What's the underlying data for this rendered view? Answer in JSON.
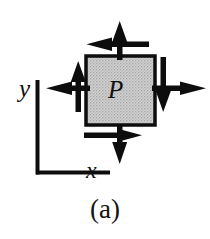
{
  "figure": {
    "caption": "(a)",
    "element_label": "P",
    "axes": {
      "y_label": "y",
      "x_label": "x"
    },
    "colors": {
      "stroke": "#0d0d0d",
      "element_fill": "#c9c9c9",
      "background": "#ffffff"
    },
    "element": {
      "shape": "square",
      "x": 86,
      "y": 56,
      "width": 69,
      "height": 69,
      "fill_pattern": "gray-stipple"
    },
    "arrows": [
      {
        "name": "top-normal-arrow",
        "direction": "up",
        "face": "top",
        "kind": "normal-tension",
        "x1": 120,
        "y1": 56,
        "x2": 120,
        "y2": 22
      },
      {
        "name": "top-shear-arrow",
        "direction": "left",
        "face": "top",
        "kind": "shear",
        "x1": 148,
        "y1": 44,
        "x2": 87,
        "y2": 44
      },
      {
        "name": "right-normal-arrow",
        "direction": "right",
        "face": "right",
        "kind": "normal-tension",
        "x1": 155,
        "y1": 88,
        "x2": 206,
        "y2": 88
      },
      {
        "name": "right-shear-arrow",
        "direction": "down",
        "face": "right",
        "kind": "shear",
        "x1": 163,
        "y1": 57,
        "x2": 163,
        "y2": 112
      },
      {
        "name": "bottom-normal-arrow",
        "direction": "down",
        "face": "bottom",
        "kind": "normal-tension",
        "x1": 120,
        "y1": 125,
        "x2": 120,
        "y2": 164
      },
      {
        "name": "bottom-shear-arrow",
        "direction": "right",
        "face": "bottom",
        "kind": "shear",
        "x1": 84,
        "y1": 135,
        "x2": 142,
        "y2": 135
      },
      {
        "name": "left-normal-arrow",
        "direction": "left",
        "face": "left",
        "kind": "normal-tension",
        "x1": 86,
        "y1": 88,
        "x2": 46,
        "y2": 88
      },
      {
        "name": "left-shear-arrow",
        "direction": "up",
        "face": "left",
        "kind": "shear",
        "x1": 78,
        "y1": 112,
        "x2": 78,
        "y2": 61
      }
    ],
    "axis_lines": {
      "vertical": {
        "x": 37,
        "y_top": 80,
        "y_bottom": 174
      },
      "horizontal": {
        "y": 174,
        "x_left": 37,
        "x_right": 110
      }
    }
  }
}
